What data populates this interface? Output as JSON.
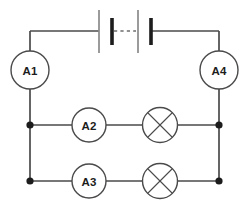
{
  "diagram": {
    "type": "electrical-circuit-schematic",
    "background_color": "#ffffff",
    "wire_color": "#4a4a4a",
    "node_color": "#1c1c1c",
    "label_color": "#1c1c1c"
  },
  "ammeters": [
    {
      "id": "A1",
      "label": "A1",
      "cx": 30,
      "cy": 70,
      "r": 19,
      "branch": "left-trunk"
    },
    {
      "id": "A4",
      "label": "A4",
      "cx": 219,
      "cy": 70,
      "r": 19,
      "branch": "right-trunk"
    },
    {
      "id": "A2",
      "label": "A2",
      "cx": 89,
      "cy": 125,
      "r": 17,
      "branch": "upper-parallel"
    },
    {
      "id": "A3",
      "label": "A3",
      "cx": 89,
      "cy": 181,
      "r": 17,
      "branch": "lower-parallel"
    }
  ],
  "lamps": [
    {
      "id": "L1",
      "symbol": "lamp-cross",
      "cx": 160,
      "cy": 125,
      "r": 17.5,
      "branch": "upper-parallel"
    },
    {
      "id": "L2",
      "symbol": "lamp-cross",
      "cx": 160,
      "cy": 181,
      "r": 17.5,
      "branch": "lower-parallel"
    }
  ],
  "battery": {
    "id": "BAT1",
    "symbol": "battery-multi-cell",
    "cells": 2,
    "center_break": "dashed",
    "plates": [
      {
        "kind": "long",
        "x": 99,
        "y1": 10,
        "y2": 53
      },
      {
        "kind": "short",
        "x": 112,
        "y1": 18,
        "y2": 45
      },
      {
        "kind": "long",
        "x": 138,
        "y1": 10,
        "y2": 53
      },
      {
        "kind": "short",
        "x": 151,
        "y1": 18,
        "y2": 45
      }
    ],
    "dash_segment": {
      "x1": 114,
      "y1": 31,
      "x2": 136,
      "y2": 31
    }
  },
  "junctions": [
    {
      "id": "J-upper-left",
      "cx": 30,
      "cy": 125,
      "r": 3.6
    },
    {
      "id": "J-upper-right",
      "cx": 219,
      "cy": 125,
      "r": 3.6
    },
    {
      "id": "J-lower-left",
      "cx": 30,
      "cy": 181,
      "r": 3.6
    },
    {
      "id": "J-lower-right",
      "cx": 219,
      "cy": 181,
      "r": 3.6
    }
  ],
  "wires": {
    "top_left_lead": "M 30 31 L 99 31",
    "top_right_lead": "M 151 31 L 219 31",
    "left_trunk_upper": "M 30 31 L 30 51",
    "left_trunk_lower": "M 30 89 L 30 181",
    "right_trunk_upper": "M 219 31 L 219 51",
    "right_trunk_lower": "M 219 89 L 219 181",
    "upper_branch_a": "M 30 125 L 72 125",
    "upper_branch_b": "M 106 125 L 142.5 125",
    "upper_branch_c": "M 177.5 125 L 219 125",
    "lower_branch_a": "M 30 181 L 72 181",
    "lower_branch_b": "M 106 181 L 142.5 181",
    "lower_branch_c": "M 177.5 181 L 219 181"
  }
}
